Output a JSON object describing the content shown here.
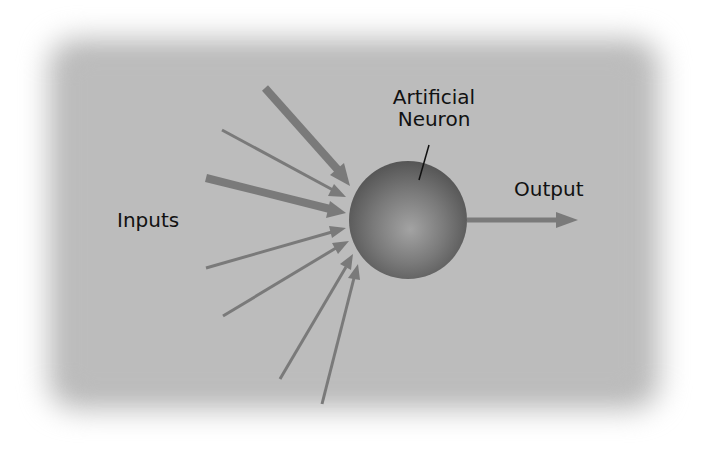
{
  "diagram": {
    "title": "Artificial Neuron",
    "labels": {
      "neuron_line1": "Artificial",
      "neuron_line2": "Neuron",
      "inputs": "Inputs",
      "output": "Output"
    },
    "colors": {
      "background": "#bcbcbc",
      "arrow": "#7a7a7a",
      "sphere_dark": "#5a5a5a",
      "sphere_light": "#9a9a9a",
      "text": "#111111"
    },
    "neuron": {
      "cx": 408,
      "cy": 220,
      "r": 59
    },
    "input_arrows": [
      {
        "from": [
          265,
          88
        ],
        "to": [
          350,
          185
        ],
        "weight": "heavy"
      },
      {
        "from": [
          222,
          130
        ],
        "to": [
          345,
          196
        ],
        "weight": "thin"
      },
      {
        "from": [
          206,
          178
        ],
        "to": [
          345,
          213
        ],
        "weight": "heavy"
      },
      {
        "from": [
          206,
          268
        ],
        "to": [
          345,
          228
        ],
        "weight": "thin"
      },
      {
        "from": [
          223,
          316
        ],
        "to": [
          348,
          241
        ],
        "weight": "thin"
      },
      {
        "from": [
          280,
          379
        ],
        "to": [
          353,
          255
        ],
        "weight": "thin"
      },
      {
        "from": [
          322,
          404
        ],
        "to": [
          357,
          264
        ],
        "weight": "thin"
      }
    ],
    "output_arrow": {
      "from": [
        467,
        220
      ],
      "to": [
        578,
        220
      ]
    },
    "pointer_line": {
      "from": [
        429,
        145
      ],
      "to": [
        419,
        180
      ]
    }
  }
}
